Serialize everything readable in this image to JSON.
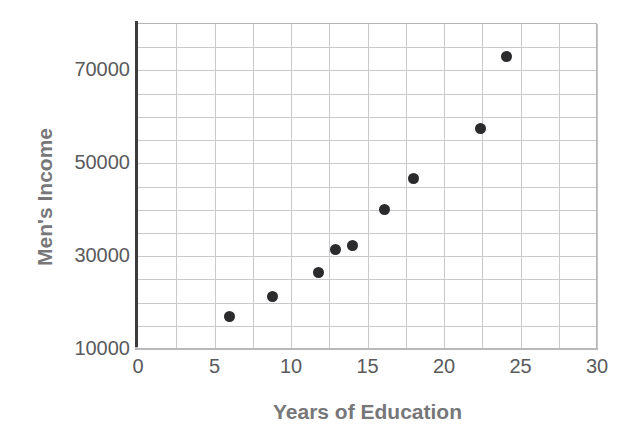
{
  "chart_data": {
    "type": "scatter",
    "title": "",
    "xlabel": "Years of Education",
    "ylabel": "Men's Income",
    "xlim": [
      0,
      30
    ],
    "ylim": [
      10000,
      80000
    ],
    "xticks": [
      0,
      5,
      10,
      15,
      20,
      25,
      30
    ],
    "xtick_labels": [
      "0",
      "5",
      "10",
      "15",
      "20",
      "25",
      "30"
    ],
    "yticks": [
      10000,
      30000,
      50000,
      70000
    ],
    "ytick_labels": [
      "10000",
      "30000",
      "50000",
      "70000"
    ],
    "x_gridline_step": 2.5,
    "y_gridline_step": 5000,
    "grid": true,
    "legend": "none",
    "marker": "filled-circle",
    "marker_color": "#2b2b2d",
    "axis_color": "#3c3c3e",
    "grid_color": "#c9c9cb",
    "label_color": "#77777a",
    "tick_color": "#5a5a5d",
    "points": [
      {
        "x": 6.0,
        "y": 17000
      },
      {
        "x": 8.8,
        "y": 21300
      },
      {
        "x": 11.8,
        "y": 26500
      },
      {
        "x": 12.9,
        "y": 31400
      },
      {
        "x": 14.0,
        "y": 32200
      },
      {
        "x": 16.1,
        "y": 40000
      },
      {
        "x": 18.0,
        "y": 46700
      },
      {
        "x": 22.4,
        "y": 57400
      },
      {
        "x": 24.1,
        "y": 73000
      }
    ],
    "series": [
      {
        "name": "Men's Income vs Years of Education",
        "x": [
          6.0,
          8.8,
          11.8,
          12.9,
          14.0,
          16.1,
          18.0,
          22.4,
          24.1
        ],
        "values": [
          17000,
          21300,
          26500,
          31400,
          32200,
          40000,
          46700,
          57400,
          73000
        ]
      }
    ]
  }
}
